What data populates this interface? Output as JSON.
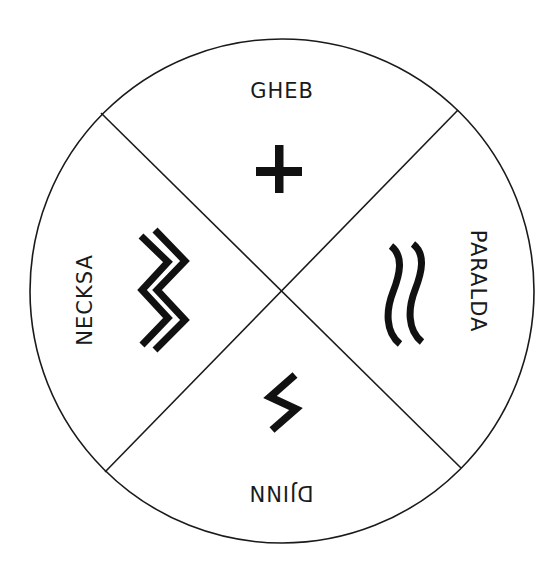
{
  "diagram": {
    "colors": {
      "background": "#ffffff",
      "line": "#1a1a1a",
      "symbol": "#111111"
    },
    "quadrants": [
      {
        "position": "top",
        "label": "GHEB",
        "symbol": "plus-icon",
        "label_rotation": 0
      },
      {
        "position": "right",
        "label": "PARALDA",
        "symbol": "double-wave-icon",
        "label_rotation": 90
      },
      {
        "position": "bottom",
        "label": "DJINN",
        "symbol": "lightning-bolt-icon",
        "label_rotation": 180
      },
      {
        "position": "left",
        "label": "NECKSA",
        "symbol": "double-zigzag-icon",
        "label_rotation": -90
      }
    ]
  }
}
